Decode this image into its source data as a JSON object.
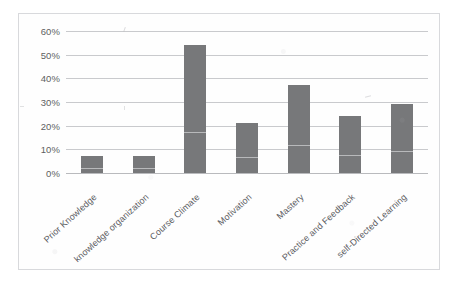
{
  "chart_data": {
    "type": "bar",
    "title": "",
    "subtitle": "",
    "xlabel": "",
    "ylabel": "",
    "categories": [
      "Prior Knowledge",
      "knowledge organization",
      "Course Climate",
      "Motivation",
      "Mastery",
      "Practice and Feedback",
      "self-Directed Learning"
    ],
    "values": [
      7,
      7,
      54,
      21,
      37,
      24,
      29
    ],
    "value_labels": [
      "7%",
      "7%",
      "54%",
      "21%",
      "37%",
      "24%",
      "29%"
    ],
    "ylim": [
      0,
      60
    ],
    "ytick_values": [
      0,
      10,
      20,
      30,
      40,
      50,
      60
    ],
    "ytick_labels": [
      "0%",
      "10%",
      "20%",
      "30%",
      "40%",
      "50%",
      "60%"
    ],
    "grid": true,
    "grid_orientation": "horizontal",
    "legend": false,
    "legend_position": "none",
    "series": [
      {
        "name": "",
        "values": [
          7,
          7,
          54,
          21,
          37,
          24,
          29
        ]
      }
    ]
  },
  "style": {
    "bar_color": "#77787a",
    "gridline_color": "#c9cacd",
    "axis_color": "#b9babd",
    "tick_label_color": "#5d5e61",
    "category_label_color": "#5a5b5e",
    "plot_background": "#fefefe",
    "frame_border_color": "#d8d9dc",
    "page_background": "#ffffff"
  }
}
